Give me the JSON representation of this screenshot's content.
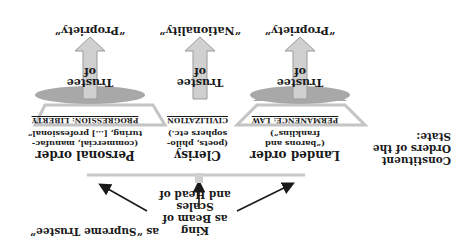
{
  "rotation_deg": 180,
  "title": {
    "line1": "Constituent",
    "line2": "Orders of the",
    "line3": "State:"
  },
  "king": {
    "line1": "King",
    "line2": "as Beam of Scales",
    "line3": "and Head of"
  },
  "supreme": "as “Supreme Trustee”",
  "orders": [
    {
      "name": "Landed order",
      "desc1": "(“barons and",
      "desc2": "franklins”)",
      "band": "PERMANENCE: LAW",
      "trustee1": "Trustee",
      "trustee2": "of",
      "target": "“Propriety”"
    },
    {
      "name": "Clerisy",
      "desc1": "(poets, philo-",
      "desc2": "sophers etc.)",
      "band": "CIVILIZATION",
      "trustee1": "Trustee",
      "trustee2": "of",
      "target": "“Nationality”"
    },
    {
      "name": "Personal order",
      "desc1": "(commercial, manufac-",
      "desc2": "turing, […] professional”",
      "band": "PROGRESSION: LIBERTY",
      "trustee1": "Trustee",
      "trustee2": "of",
      "target": "“Propriety”"
    }
  ],
  "colors": {
    "band_fill": "#a8a8a8",
    "band_outline": "#c4c4c4",
    "arrow_fill": "#d0d0d0",
    "arrow_stroke": "#9a9a9a",
    "line": "#c8c8c8"
  }
}
